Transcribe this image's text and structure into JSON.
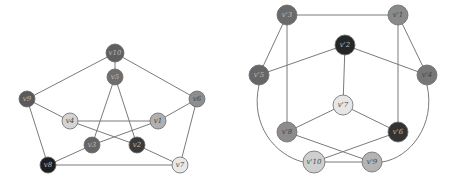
{
  "diagram": {
    "left_graph": {
      "title": "Petersen graph",
      "nodes": [
        {
          "id": "v10",
          "label": "v10",
          "x": 115,
          "y": 53,
          "r": 9,
          "fill": "#5f5f5f"
        },
        {
          "id": "v5",
          "label": "v5",
          "x": 115,
          "y": 77,
          "r": 8,
          "fill": "#6e6e6e"
        },
        {
          "id": "v9",
          "label": "v9",
          "x": 27,
          "y": 99,
          "r": 8,
          "fill": "#5a5a5a"
        },
        {
          "id": "v6",
          "label": "v6",
          "x": 197,
          "y": 99,
          "r": 8,
          "fill": "#8e8e8e"
        },
        {
          "id": "v4",
          "label": "v4",
          "x": 70,
          "y": 121,
          "r": 8,
          "fill": "#d4d4d4"
        },
        {
          "id": "v1",
          "label": "v1",
          "x": 158,
          "y": 121,
          "r": 8,
          "fill": "#b0b0b0"
        },
        {
          "id": "v3",
          "label": "v3",
          "x": 92,
          "y": 145,
          "r": 8,
          "fill": "#666666"
        },
        {
          "id": "v2",
          "label": "v2",
          "x": 137,
          "y": 145,
          "r": 8,
          "fill": "#3a3a3a"
        },
        {
          "id": "v8",
          "label": "v8",
          "x": 48,
          "y": 165,
          "r": 8,
          "fill": "#1e1e1e"
        },
        {
          "id": "v7",
          "label": "v7",
          "x": 180,
          "y": 165,
          "r": 8,
          "fill": "#e8e8e8"
        }
      ],
      "edges": [
        [
          "v10",
          "v5"
        ],
        [
          "v10",
          "v9"
        ],
        [
          "v10",
          "v6"
        ],
        [
          "v9",
          "v8"
        ],
        [
          "v6",
          "v7"
        ],
        [
          "v8",
          "v7"
        ],
        [
          "v9",
          "v4"
        ],
        [
          "v6",
          "v1"
        ],
        [
          "v8",
          "v3"
        ],
        [
          "v7",
          "v2"
        ],
        [
          "v5",
          "v3"
        ],
        [
          "v5",
          "v2"
        ],
        [
          "v4",
          "v1"
        ],
        [
          "v4",
          "v2"
        ],
        [
          "v1",
          "v3"
        ]
      ]
    },
    "right_graph": {
      "title": "Isomorphic drawing",
      "nodes": [
        {
          "id": "v3p",
          "label": "v'3",
          "x": 287,
          "y": 15,
          "r": 10,
          "fill": "#6a6a6a"
        },
        {
          "id": "v1p",
          "label": "v'1",
          "x": 398,
          "y": 15,
          "r": 10,
          "fill": "#8a8a8a"
        },
        {
          "id": "v2p",
          "label": "v'2",
          "x": 345,
          "y": 45,
          "r": 10,
          "fill": "#262626"
        },
        {
          "id": "v5p",
          "label": "v'5",
          "x": 259,
          "y": 75,
          "r": 10,
          "fill": "#666666"
        },
        {
          "id": "v4p",
          "label": "v'4",
          "x": 427,
          "y": 75,
          "r": 10,
          "fill": "#777777"
        },
        {
          "id": "v7p",
          "label": "v'7",
          "x": 343,
          "y": 105,
          "r": 10,
          "fill": "#e6e6e6"
        },
        {
          "id": "v8p",
          "label": "v'8",
          "x": 287,
          "y": 132,
          "r": 10,
          "fill": "#8c8c8c"
        },
        {
          "id": "v6p",
          "label": "v'6",
          "x": 398,
          "y": 132,
          "r": 10,
          "fill": "#333333"
        },
        {
          "id": "v10p",
          "label": "v'10",
          "x": 314,
          "y": 162,
          "r": 11,
          "fill": "#cfcfcf"
        },
        {
          "id": "v9p",
          "label": "v'9",
          "x": 372,
          "y": 162,
          "r": 10,
          "fill": "#b4b4b4"
        }
      ],
      "edges": [
        [
          "v3p",
          "v1p"
        ],
        [
          "v3p",
          "v5p"
        ],
        [
          "v3p",
          "v8p"
        ],
        [
          "v1p",
          "v4p"
        ],
        [
          "v1p",
          "v6p"
        ],
        [
          "v2p",
          "v5p"
        ],
        [
          "v2p",
          "v4p"
        ],
        [
          "v2p",
          "v7p"
        ],
        [
          "v7p",
          "v8p"
        ],
        [
          "v7p",
          "v6p"
        ],
        [
          "v8p",
          "v9p"
        ],
        [
          "v6p",
          "v10p"
        ],
        [
          "v10p",
          "v9p"
        ]
      ],
      "curved_edges": [
        {
          "from": "v5p",
          "to": "v10p",
          "path": "M259,85 C250,125 275,155 303,162"
        },
        {
          "from": "v4p",
          "to": "v9p",
          "path": "M427,85 C436,125 410,158 382,162"
        }
      ]
    }
  }
}
